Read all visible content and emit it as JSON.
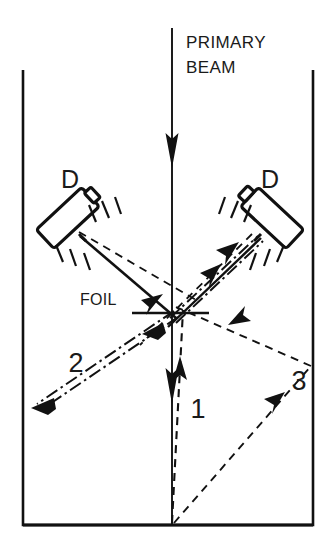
{
  "figure": {
    "width": 332,
    "height": 552,
    "background_color": "#ffffff",
    "ink_color": "#111111"
  },
  "labels": {
    "primary_beam_line1": "PRIMARY",
    "primary_beam_line2": "BEAM",
    "detector_left": "D",
    "detector_right": "D",
    "foil": "FOIL",
    "trajectory_1": "1",
    "trajectory_2": "2",
    "trajectory_3": "3"
  },
  "chamber": {
    "left_wall_x": 23,
    "right_wall_x": 313,
    "top_y": 70,
    "bottom_y": 525,
    "stroke_width": 2.6
  },
  "primary_beam": {
    "x": 172,
    "start_y": 28,
    "end_y": 525,
    "arrow_head_1_tip_y": 166,
    "arrow_head_2_tip_y": 402,
    "stroke_width": 1.8
  },
  "foil": {
    "center_x": 171,
    "center_y": 313,
    "left_x": 132,
    "right_x": 209,
    "stroke_width": 2.4
  },
  "detectors": [
    {
      "name": "detector-left",
      "head_center_x": 70,
      "head_center_y": 216,
      "rotation_deg": -43,
      "label_x": 70,
      "label_y": 185
    },
    {
      "name": "detector-right",
      "head_center_x": 270,
      "head_center_y": 216,
      "rotation_deg": 43,
      "label_x": 270,
      "label_y": 185
    }
  ],
  "trajectories": [
    {
      "id": "1",
      "style": "dashed",
      "label_x": 198,
      "label_y": 408,
      "description": "dashed path from chamber bottom centre upward to foil"
    },
    {
      "id": "2",
      "style": "double-dash-dot",
      "label_x": 76,
      "label_y": 363,
      "description": "double dash-dot path from foil down-left to lower-left wall"
    },
    {
      "id": "3",
      "style": "dashed",
      "label_x": 299,
      "label_y": 380,
      "description": "dashed path from chamber bottom centre up-right to right wall then up-left to foil"
    }
  ]
}
